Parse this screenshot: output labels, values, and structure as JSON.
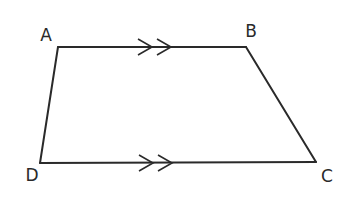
{
  "diagram": {
    "type": "trapezium",
    "stroke_color": "#2a2a2a",
    "background": "#ffffff",
    "vertices": [
      {
        "label": "A",
        "x": 58,
        "y": 47,
        "label_x": 46,
        "label_y": 41
      },
      {
        "label": "B",
        "x": 246,
        "y": 47,
        "label_x": 251,
        "label_y": 37
      },
      {
        "label": "C",
        "x": 316,
        "y": 162,
        "label_x": 327,
        "label_y": 182
      },
      {
        "label": "D",
        "x": 40,
        "y": 163,
        "label_x": 32,
        "label_y": 181
      }
    ],
    "edges": [
      {
        "from": "A",
        "to": "B",
        "parallel_marks": 2
      },
      {
        "from": "B",
        "to": "C",
        "parallel_marks": 0
      },
      {
        "from": "C",
        "to": "D",
        "parallel_marks": 2
      },
      {
        "from": "D",
        "to": "A",
        "parallel_marks": 0
      }
    ],
    "parallel_marks": [
      {
        "edge": "AB",
        "tips": [
          {
            "x": 152,
            "y": 47
          },
          {
            "x": 171,
            "y": 47
          }
        ]
      },
      {
        "edge": "DC",
        "tips": [
          {
            "x": 153,
            "y": 163
          },
          {
            "x": 172,
            "y": 163
          }
        ]
      }
    ],
    "labels": {
      "A": "A",
      "B": "B",
      "C": "C",
      "D": "D"
    }
  }
}
